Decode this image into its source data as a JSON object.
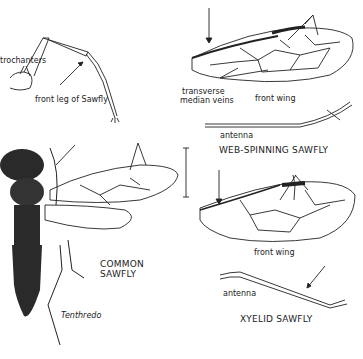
{
  "figure": {
    "labels": {
      "trochanters": "trochanters",
      "front_leg": "front leg of Sawfly",
      "transverse_1": "transverse",
      "transverse_2": "median veins",
      "front_wing_top": "front wing",
      "antenna_web": "antenna",
      "web_spinning": "WEB-SPINNING SAWFLY",
      "common_1": "COMMON",
      "common_2": "SAWFLY",
      "genus": "Tenthredo",
      "front_wing_bottom": "front wing",
      "antenna_xyelid": "antenna",
      "xyelid": "XYELID SAWFLY"
    },
    "colors": {
      "ink": "#222222",
      "paper": "#ffffff",
      "body_dark": "#2a2a2a"
    }
  }
}
